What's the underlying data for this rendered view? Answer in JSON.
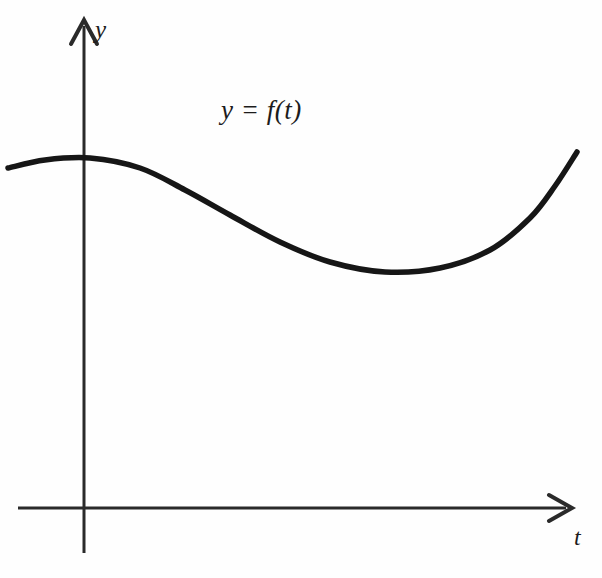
{
  "figure": {
    "name": "graph-of-function-y-equals-f-of-t",
    "background_color": "#fefefe",
    "stroke_color": "#1c1c1c",
    "axis_color": "#2a2a2a",
    "curve_color": "#161616"
  },
  "labels": {
    "y_axis_label": "y",
    "t_axis_label": "t",
    "function_label": "y = f(t)"
  },
  "chart_data": {
    "type": "line",
    "title": "",
    "subtitle": "",
    "xlabel": "t",
    "ylabel": "y",
    "annotations": [
      "y = f(t)"
    ],
    "legend": [],
    "legend_position": "none",
    "grid": false,
    "axis_style": "arrow-tipped axes with origin, no tick marks, no tick labels",
    "origin_px": [
      84,
      508
    ],
    "xlim_px": [
      18,
      572
    ],
    "ylim_px": [
      20,
      553
    ],
    "series": [
      {
        "name": "f(t)",
        "description": "smooth wave: flat maximum just right of the y-axis, descending through an inflection, a broad minimum near the middle-right, then rising steeply to the right edge",
        "points_px": [
          [
            8,
            168
          ],
          [
            45,
            160
          ],
          [
            90,
            158
          ],
          [
            140,
            168
          ],
          [
            185,
            190
          ],
          [
            230,
            215
          ],
          [
            280,
            242
          ],
          [
            330,
            262
          ],
          [
            385,
            272
          ],
          [
            440,
            268
          ],
          [
            490,
            250
          ],
          [
            530,
            218
          ],
          [
            555,
            186
          ],
          [
            577,
            152
          ]
        ]
      }
    ]
  }
}
